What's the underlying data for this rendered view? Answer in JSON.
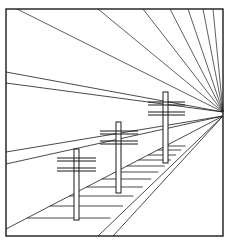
{
  "figure": {
    "width": 231,
    "height": 247,
    "colors": {
      "stroke": "#1a1a1a",
      "background": "#ffffff"
    },
    "frame": {
      "x1": 6,
      "y1": 9,
      "x2": 223,
      "y2": 236
    },
    "vanishing_point": {
      "x": 223,
      "y": 112
    },
    "top_rays_start_x": [
      17,
      98,
      143,
      170,
      188,
      203,
      213
    ],
    "left_rays_start_y": [
      72,
      83
    ],
    "lower_rays_start": [
      {
        "x": 6,
        "y": 152
      },
      {
        "x": 6,
        "y": 164
      },
      {
        "x": 6,
        "y": 229
      },
      {
        "x": 98,
        "y": 236
      },
      {
        "x": 113,
        "y": 236
      }
    ],
    "poles": [
      {
        "name": "far",
        "x": 163,
        "w": 5,
        "top": 92,
        "bottom": 163,
        "bars": [
          102,
          105,
          112,
          115
        ],
        "bar_x1": 148,
        "bar_x2": 185
      },
      {
        "name": "middle",
        "x": 116,
        "w": 5,
        "top": 122,
        "bottom": 193,
        "bars": [
          131,
          134,
          141,
          144
        ],
        "bar_x1": 100,
        "bar_x2": 138
      },
      {
        "name": "near",
        "x": 74,
        "w": 5,
        "top": 149,
        "bottom": 220,
        "bars": [
          158,
          161,
          168,
          171
        ],
        "bar_x1": 57,
        "bar_x2": 96
      }
    ],
    "sleepers_y": [
      146,
      150,
      155,
      160,
      166,
      172,
      179,
      187,
      196,
      206,
      218
    ]
  }
}
